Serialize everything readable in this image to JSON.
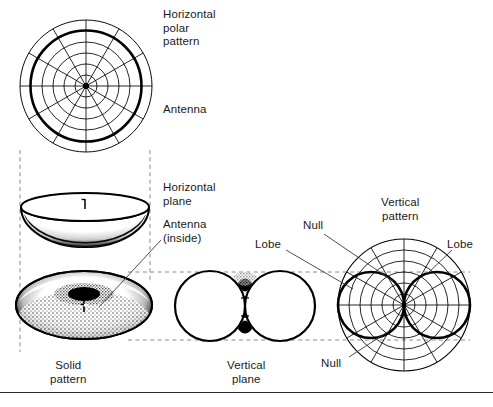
{
  "figure": {
    "background_color": "#ffffff",
    "ink_color": "#000000",
    "width": 493,
    "height": 407
  },
  "labels": {
    "horizontal_polar_pattern": "Horizontal\npolar\npattern",
    "antenna": "Antenna",
    "horizontal_plane": "Horizontal\nplane",
    "antenna_inside": "Antenna\n(inside)",
    "vertical_pattern": "Vertical\npattern",
    "null_top": "Null",
    "null_bottom": "Null",
    "lobe_left": "Lobe",
    "lobe_right": "Lobe",
    "solid_pattern": "Solid\npattern",
    "vertical_plane": "Vertical\nplane"
  },
  "caption": "",
  "diagrams": {
    "horizontal_polar": {
      "name": "horizontal-polar-pattern",
      "type": "polar-grid",
      "center": [
        86,
        86
      ],
      "outer_radius": 66,
      "rings": 6,
      "spokes": 12,
      "bold_ring_index": 5,
      "has_center_dot": true
    },
    "horizontal_plane_dish": {
      "name": "horizontal-plane-dish",
      "type": "3d-dish",
      "center": [
        85,
        207
      ],
      "rx": 64,
      "ry": 14,
      "depth": 32
    },
    "solid_pattern_torus": {
      "name": "solid-pattern-torus",
      "type": "3d-torus",
      "center": [
        84,
        305
      ],
      "rx": 68,
      "ry": 34,
      "hole_rx": 16,
      "hole_ry": 7
    },
    "vertical_plane_lobes": {
      "name": "vertical-plane-figure-eight",
      "type": "two-circle-lobes",
      "center": [
        245,
        306
      ],
      "lobe_radius": 35
    },
    "vertical_polar": {
      "name": "vertical-pattern-polar",
      "type": "polar-grid",
      "center": [
        404,
        305
      ],
      "outer_radius": 66,
      "rings": 6,
      "spokes": 12,
      "lobe_radius": 33
    }
  },
  "projection_lines": {
    "style": "dashed",
    "color": "#7a7a7a",
    "vertical": [
      {
        "x": 20,
        "y1": 150,
        "y2": 352
      },
      {
        "x": 150,
        "y1": 150,
        "y2": 280
      }
    ],
    "horizontal": [
      {
        "y": 272,
        "x1": 128,
        "x2": 470
      },
      {
        "y": 340,
        "x1": 128,
        "x2": 470
      }
    ]
  },
  "leader_lines": {
    "antenna_inside": {
      "from": [
        163,
        240
      ],
      "to": [
        98,
        308
      ]
    },
    "null_top": {
      "from": [
        325,
        235
      ],
      "to": [
        392,
        278
      ]
    },
    "lobe_left": {
      "from": [
        285,
        252
      ],
      "to": [
        352,
        288
      ]
    },
    "lobe_right": {
      "from": [
        452,
        252
      ],
      "to": [
        424,
        276
      ]
    },
    "null_bottom": {
      "from": [
        350,
        358
      ],
      "to": [
        390,
        330
      ]
    }
  }
}
